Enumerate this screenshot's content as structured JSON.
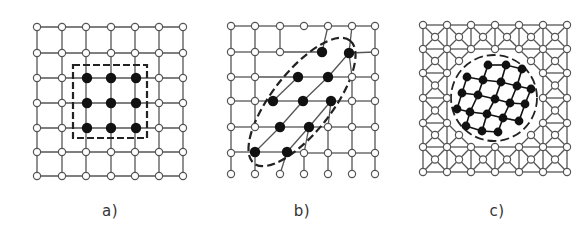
{
  "figure": {
    "panels": [
      {
        "id": "a",
        "label": "a)",
        "label_pos": [
          110,
          202
        ],
        "grid_x": [
          37,
          62,
          86,
          111,
          135,
          159,
          183
        ],
        "grid_y": [
          27,
          53,
          78,
          103,
          128,
          152,
          176
        ],
        "lattice": "square",
        "filled_nodes": [
          [
            87,
            78
          ],
          [
            111,
            78
          ],
          [
            136,
            78
          ],
          [
            87,
            103
          ],
          [
            111,
            103
          ],
          [
            136,
            103
          ],
          [
            87,
            128
          ],
          [
            111,
            128
          ],
          [
            136,
            128
          ]
        ],
        "boundary": {
          "shape": "rect",
          "x": 73,
          "y": 65,
          "w": 74,
          "h": 73
        },
        "description": "square lattice with 3x3 block of filled atoms enclosed by dashed square"
      },
      {
        "id": "b",
        "label": "b)",
        "label_pos": [
          302,
          202
        ],
        "grid_x": [
          231,
          255,
          280,
          304,
          328,
          352,
          375
        ],
        "grid_y": [
          26,
          52,
          77,
          101,
          127,
          153,
          174
        ],
        "lattice": "square-open-bottom",
        "filled_nodes": [
          [
            322,
            52
          ],
          [
            349,
            53
          ],
          [
            298,
            77
          ],
          [
            328,
            77
          ],
          [
            273,
            101
          ],
          [
            303,
            101
          ],
          [
            331,
            101
          ],
          [
            280,
            127
          ],
          [
            309,
            127
          ],
          [
            255,
            152
          ],
          [
            287,
            152
          ]
        ],
        "hidden_nodes": [
          [
            304,
            52
          ],
          [
            328,
            52
          ],
          [
            352,
            52
          ],
          [
            280,
            77
          ],
          [
            304,
            77
          ],
          [
            328,
            77
          ],
          [
            280,
            101
          ],
          [
            304,
            101
          ],
          [
            328,
            101
          ],
          [
            280,
            127
          ],
          [
            304,
            127
          ],
          [
            255,
            153
          ],
          [
            280,
            153
          ]
        ],
        "boundary": {
          "shape": "ellipse",
          "cx": 302,
          "cy": 102,
          "rx": 78,
          "ry": 30,
          "rotate": -52
        },
        "description": "sheared cluster of filled atoms enclosed by dashed tilted ellipse"
      },
      {
        "id": "c",
        "label": "c)",
        "label_pos": [
          497,
          202
        ],
        "grid_x": [
          423,
          447,
          471,
          495,
          519,
          543,
          567
        ],
        "grid_y": [
          25,
          49,
          73,
          98,
          123,
          147,
          172
        ],
        "lattice": "square-with-centers",
        "filled_nodes": [
          [
            488,
            65
          ],
          [
            506,
            65
          ],
          [
            522,
            69
          ],
          [
            467,
            77
          ],
          [
            483,
            80
          ],
          [
            501,
            82
          ],
          [
            517,
            86
          ],
          [
            531,
            89
          ],
          [
            462,
            93
          ],
          [
            478,
            95
          ],
          [
            495,
            99
          ],
          [
            510,
            103
          ],
          [
            525,
            104
          ],
          [
            457,
            109
          ],
          [
            470,
            112
          ],
          [
            487,
            114
          ],
          [
            503,
            118
          ],
          [
            519,
            121
          ],
          [
            466,
            126
          ],
          [
            482,
            131
          ],
          [
            498,
            132
          ]
        ],
        "boundary": {
          "shape": "circle",
          "cx": 494,
          "cy": 98,
          "r": 43
        },
        "description": "square lattice with face-center atoms, circular region of rearranged filled atoms with dashed circle boundary"
      }
    ],
    "colors": {
      "line": "#555555",
      "node_fill_open": "#ffffff",
      "node_fill_solid": "#111111",
      "dash": "#222222"
    }
  }
}
